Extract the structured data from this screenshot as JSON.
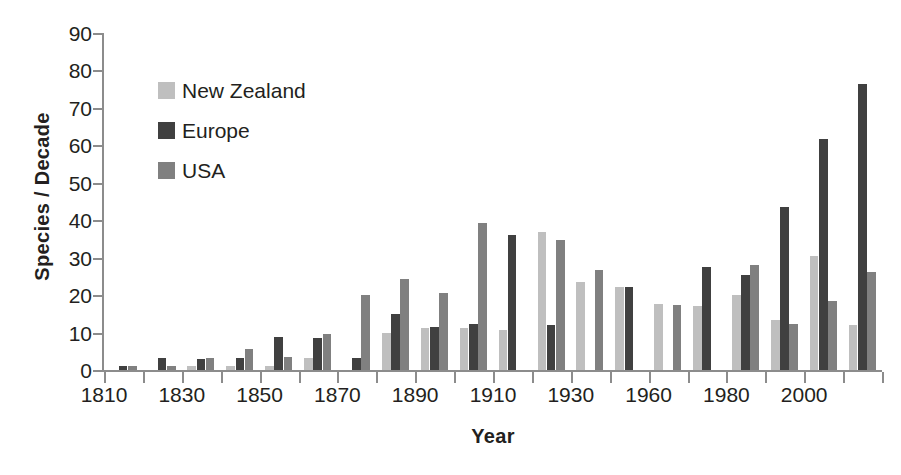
{
  "chart_data": {
    "type": "bar",
    "title": "",
    "subtitle": "",
    "xlabel": "Year",
    "ylabel": "Species / Decade",
    "ylim": [
      0,
      90
    ],
    "ytick_step": 10,
    "yticks": [
      0,
      10,
      20,
      30,
      40,
      50,
      60,
      70,
      80,
      90
    ],
    "grid": false,
    "legend_position": "upper-left-inside",
    "orientation": "vertical",
    "bar_grouping": "grouped",
    "x": [
      1820,
      1830,
      1840,
      1850,
      1860,
      1870,
      1880,
      1890,
      1900,
      1910,
      1920,
      1930,
      1940,
      1950,
      1960,
      1970,
      1980,
      1990,
      2000,
      2010
    ],
    "categories": [
      "1820",
      "1830",
      "1840",
      "1850",
      "1860",
      "1870",
      "1880",
      "1890",
      "1900",
      "1910",
      "1920",
      "1930",
      "1940",
      "1950",
      "1960",
      "1970",
      "1980",
      "1990",
      "2000",
      "2010"
    ],
    "xtick_labels": [
      "1810",
      "1830",
      "1850",
      "1870",
      "1890",
      "1910",
      "1930",
      "1960",
      "1980",
      "2000"
    ],
    "xtick_all_count": 21,
    "xtick_label_every": 2,
    "series": [
      {
        "name": "New Zealand",
        "color": "#bfbfbf",
        "values": [
          0,
          0,
          1.2,
          1.2,
          1.2,
          3.3,
          0,
          9.9,
          11.3,
          11.3,
          10.8,
          36.9,
          23.4,
          22.1,
          17.5,
          17.2,
          20.1,
          13.3,
          30.5,
          12.0
        ]
      },
      {
        "name": "Europe",
        "color": "#404040",
        "values": [
          1.2,
          3.2,
          3.0,
          3.1,
          8.7,
          8.6,
          3.2,
          15.0,
          11.6,
          12.4,
          36.0,
          12.1,
          0,
          22.2,
          0,
          27.6,
          25.4,
          43.6,
          61.8,
          76.3
        ]
      },
      {
        "name": "USA",
        "color": "#808080",
        "values": [
          1.1,
          1.2,
          3.2,
          5.6,
          3.5,
          9.5,
          20.1,
          24.4,
          20.7,
          39.3,
          0,
          34.6,
          26.6,
          0,
          17.4,
          0,
          28.0,
          12.2,
          18.4,
          26.3
        ]
      }
    ]
  },
  "legend": {
    "items": [
      {
        "label": "New Zealand",
        "color": "#bfbfbf"
      },
      {
        "label": "Europe",
        "color": "#404040"
      },
      {
        "label": "USA",
        "color": "#808080"
      }
    ]
  },
  "axis": {
    "y_title": "Species / Decade",
    "x_title": "Year"
  },
  "colors": {
    "new_zealand": "#bfbfbf",
    "europe": "#404040",
    "usa": "#808080",
    "axis": "#8c8c8c",
    "text": "#231f20",
    "background": "#ffffff"
  }
}
